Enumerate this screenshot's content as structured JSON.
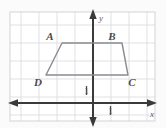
{
  "figure": {
    "background_color": "#fbfbfb",
    "grid": {
      "line_color": "#d8d8dc",
      "border_color": "#cfcfd4",
      "cell_size_px": 18,
      "columns": 8,
      "rows": 6,
      "show_grid": true
    },
    "axes": {
      "axis_color": "#3a3a3a",
      "x_axis_label": "x",
      "y_axis_label": "y",
      "x_unit_label": "1",
      "y_unit_label": "1",
      "origin_px": {
        "x": 93,
        "y": 103
      }
    },
    "shape": {
      "name": "trapezoid",
      "stroke_color": "#8a8a90",
      "fill": "none",
      "vertices": [
        {
          "label": "A",
          "px": {
            "x": 62,
            "y": 43
          },
          "label_px": {
            "x": 50,
            "y": 40
          }
        },
        {
          "label": "B",
          "px": {
            "x": 122,
            "y": 43
          },
          "label_px": {
            "x": 110,
            "y": 40
          }
        },
        {
          "label": "C",
          "px": {
            "x": 128,
            "y": 75
          },
          "label_px": {
            "x": 129,
            "y": 86
          }
        },
        {
          "label": "D",
          "px": {
            "x": 46,
            "y": 75
          },
          "label_px": {
            "x": 35,
            "y": 86
          }
        }
      ]
    }
  }
}
